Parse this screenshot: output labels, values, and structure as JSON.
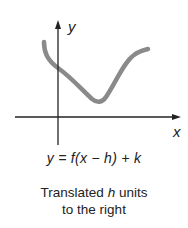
{
  "figure": {
    "axes": {
      "x_label": "x",
      "y_label": "y"
    },
    "curve": {
      "color": "#8a8a8a",
      "description": "translated function graph"
    },
    "equation": "y = f(x − h) + k",
    "caption": {
      "line1_prefix": "Translated ",
      "line1_var": "h",
      "line1_suffix": " units",
      "line2": "to the right"
    }
  }
}
